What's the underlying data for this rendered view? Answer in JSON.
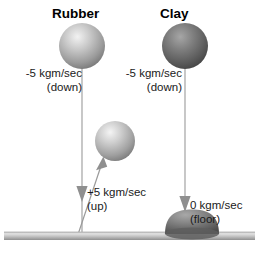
{
  "diagram": {
    "kind": "physics-momentum-comparison",
    "width": 259,
    "height": 261,
    "background": "#ffffff"
  },
  "titles": {
    "rubber": "Rubber",
    "clay": "Clay"
  },
  "labels": {
    "rubber_down": {
      "value": "-5 kgm/sec",
      "direction": "(down)"
    },
    "clay_down": {
      "value": "-5 kgm/sec",
      "direction": "(down)"
    },
    "rubber_up": {
      "value": "+5 kgm/sec",
      "direction": "(up)"
    },
    "clay_floor": {
      "value": "0 kgm/sec",
      "direction": "(floor)"
    }
  },
  "objects": {
    "rubber_ball_top": {
      "name": "rubber-ball-falling",
      "cx": 82,
      "cy": 46,
      "r": 23,
      "fill_light": "#e8e8e8",
      "fill_dark": "#7e7e7e"
    },
    "rubber_ball_bounce": {
      "name": "rubber-ball-bouncing",
      "cx": 115,
      "cy": 141,
      "r": 20,
      "fill_light": "#ececec",
      "fill_dark": "#828282"
    },
    "clay_ball_top": {
      "name": "clay-ball-falling",
      "cx": 185,
      "cy": 46,
      "r": 23,
      "fill_light": "#9a9a9a",
      "fill_dark": "#4a4a4a"
    },
    "clay_splat": {
      "name": "clay-splat-flattened",
      "cx": 192,
      "cy": 226,
      "rx": 27,
      "ry": 16,
      "fill_light": "#9a9a9a",
      "fill_dark": "#555555"
    },
    "floor": {
      "name": "floor-surface",
      "y": 232,
      "height": 8,
      "fill_light": "#d8d8d8",
      "fill_dark": "#8c8c8c"
    }
  },
  "arrows": {
    "rubber_fall": {
      "name": "rubber-downward-arrow",
      "x1": 82,
      "y1": 66,
      "x2": 82,
      "y2": 233,
      "color": "#8c8c8c",
      "head_y": 196
    },
    "rubber_bounce": {
      "name": "rubber-upward-arrow",
      "x1": 79,
      "y1": 233,
      "x2": 101,
      "y2": 157,
      "color": "#8c8c8c"
    },
    "clay_fall": {
      "name": "clay-downward-arrow",
      "x1": 185,
      "y1": 66,
      "x2": 185,
      "y2": 212,
      "color": "#8c8c8c",
      "head_y": 206
    }
  },
  "colors": {
    "line": "#8c8c8c",
    "text": "#1a1a1a",
    "title": "#000000"
  }
}
